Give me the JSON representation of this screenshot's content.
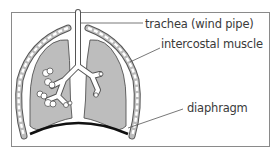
{
  "diagram": {
    "type": "anatomical-labelled-diagram",
    "labels": [
      {
        "id": "trachea",
        "text": "trachea (wind pipe)",
        "x": 145,
        "y": 17
      },
      {
        "id": "intercostal",
        "text": "intercostal muscle",
        "x": 161,
        "y": 37
      },
      {
        "id": "diaphragm",
        "text": "diaphragm",
        "x": 187,
        "y": 101
      }
    ],
    "colors": {
      "frame": "#8a8a8a",
      "lung_fill": "#bdbdbd",
      "outline": "#555555",
      "diaphragm": "#111111",
      "label_text": "#3a3a3a",
      "leader_line": "#555555"
    }
  }
}
